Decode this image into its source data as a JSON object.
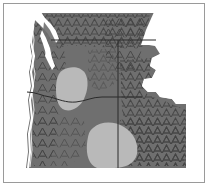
{
  "figure": {
    "kind": "thematic-map",
    "title": "",
    "caption": "",
    "width": 209,
    "height": 187,
    "background_color": "#ffffff",
    "frame": {
      "visible": true,
      "color": "#9a9a9a",
      "thickness": 1,
      "x": 3,
      "y": 3,
      "width": 201,
      "height": 180
    }
  },
  "map": {
    "region_name": "Pacific Northwest",
    "projection_note": "",
    "land_fill_color": "#6f6f6f",
    "land_texture_color": "#4a4a4a",
    "light_region_color": "#b9b9b9",
    "water_color": "#ffffff",
    "border_line_color": "#2b2b2b",
    "coast_line_color": "#ffffff",
    "texture_glyph": "chevron-hatch",
    "legend": {
      "visible": false,
      "entries": [
        {
          "label": "",
          "color": "#6f6f6f"
        },
        {
          "label": "",
          "color": "#b9b9b9"
        }
      ]
    },
    "shapes": {
      "land_outline": "M 36,13 L 156,13 L 156,17 L 147,30 L 143,44 L 155,46 L 160,54 L 152,58 L 150,66 L 156,70 L 152,78 L 144,79 L 142,86 L 148,92 L 156,92 L 160,97 L 172,99 L 176,104 L 186,104 L 188,112 L 186,168 L 24,168 L 23,150 L 26,132 L 24,112 L 28,96 L 27,80 L 31,62 L 30,44 L 34,28 Z",
      "upper_right_cut": "M 156,13 L 186,13 L 186,44 L 143,44 L 147,30 Z",
      "right_white_notch": "M 160,54 L 188,54 L 188,100 L 176,104 L 172,99 L 160,97 L 156,92 L 148,92 L 142,86 L 144,79 L 152,78 L 156,70 L 150,66 L 152,58 Z",
      "light_blob_central": "M 63,70 L 76,67 L 84,72 L 86,82 L 84,93 L 78,104 L 70,110 L 62,109 L 58,100 L 57,86 L 59,76 Z",
      "light_blob_south": "M 92,127 L 104,122 L 116,124 L 128,130 L 136,140 L 138,152 L 134,163 L 120,168 L 100,168 L 90,161 L 86,148 L 87,135 Z",
      "water_puget_sound": "M 34,14 L 40,13 L 46,20 L 52,26 L 58,36 L 56,42 L 50,40 L 46,34 L 42,28 L 36,22 Z",
      "coast_strip": "M 24,20 L 30,30 L 28,52 L 31,70 L 27,92 L 29,118 L 25,144 L 26,168"
    },
    "state_boundaries": [
      {
        "name": "north-border",
        "path": "M 50,40 L 118,40 L 156,40"
      },
      {
        "name": "wa-or-border",
        "path": "M 27,92 L 58,96 L 76,101 L 92,97 L 118,97 L 142,97"
      },
      {
        "name": "wa-id-border",
        "path": "M 118,40 L 118,97"
      },
      {
        "name": "or-id-border",
        "path": "M 118,97 L 118,168"
      }
    ]
  },
  "data_regions": [
    {
      "id": "high-texture-zone",
      "fill": "#6f6f6f",
      "textured": true
    },
    {
      "id": "low-value-blob-central",
      "fill": "#b9b9b9",
      "textured": false
    },
    {
      "id": "low-value-blob-south",
      "fill": "#b9b9b9",
      "textured": false
    },
    {
      "id": "water-body",
      "fill": "#ffffff",
      "textured": false
    }
  ]
}
